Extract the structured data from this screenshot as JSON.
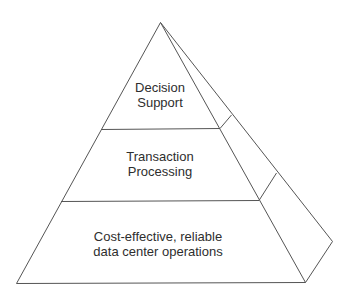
{
  "diagram": {
    "type": "pyramid",
    "line_color": "#555555",
    "text_color": "#2e2e2e",
    "tiers": [
      {
        "id": "top",
        "lines": [
          "Decision",
          "Support"
        ]
      },
      {
        "id": "middle",
        "lines": [
          "Transaction",
          "Processing"
        ]
      },
      {
        "id": "bottom",
        "lines": [
          "Cost-effective, reliable",
          "data center operations"
        ]
      }
    ]
  }
}
